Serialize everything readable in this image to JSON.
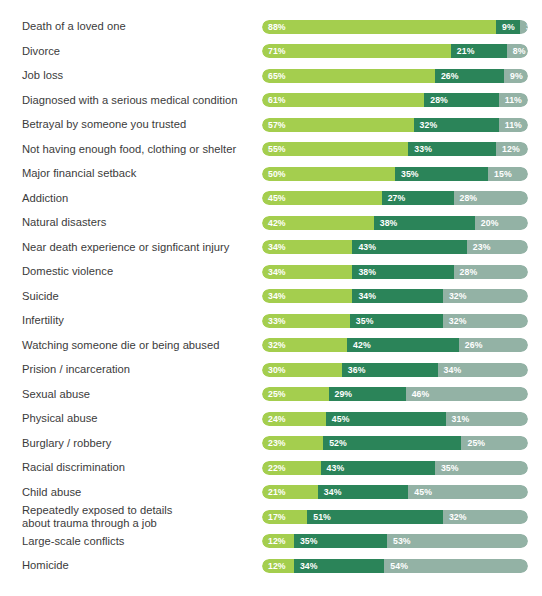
{
  "chart_data": {
    "type": "bar",
    "title": "",
    "subtitle": "",
    "xlabel": "",
    "ylabel": "",
    "orientation": "horizontal",
    "stacked": true,
    "grid": false,
    "legend_position": "none",
    "xlim": [
      0,
      100
    ],
    "value_suffix": "%",
    "colors": {
      "series1": "#a4ce4e",
      "series2": "#2b8459",
      "series3": "#93b2a5",
      "label_text": "#3b3b3b",
      "value_text": "#ffffff",
      "background": "#ffffff"
    },
    "categories": [
      "Death of a loved one",
      "Divorce",
      "Job loss",
      "Diagnosed with a serious medical condition",
      "Betrayal by someone you trusted",
      "Not having enough food, clothing or shelter",
      "Major financial setback",
      "Addiction",
      "Natural disasters",
      "Near death experience or signficant injury",
      "Domestic violence",
      "Suicide",
      "Infertility",
      "Watching someone die or being abused",
      "Prision / incarceration",
      "Sexual abuse",
      "Physical abuse",
      "Burglary / robbery",
      "Racial discrimination",
      "Child abuse",
      "Repeatedly exposed to details about trauma through a job",
      "Large-scale conflicts",
      "Homicide"
    ],
    "series": [
      {
        "name": "series1",
        "values": [
          88,
          71,
          65,
          61,
          57,
          55,
          50,
          45,
          42,
          34,
          34,
          34,
          33,
          32,
          30,
          25,
          24,
          23,
          22,
          21,
          17,
          12,
          12
        ]
      },
      {
        "name": "series2",
        "values": [
          9,
          21,
          26,
          28,
          32,
          33,
          35,
          27,
          38,
          43,
          38,
          34,
          35,
          42,
          36,
          29,
          45,
          52,
          43,
          34,
          51,
          35,
          34
        ]
      },
      {
        "name": "series3",
        "values": [
          3,
          8,
          9,
          11,
          11,
          12,
          15,
          28,
          20,
          23,
          28,
          32,
          32,
          26,
          34,
          46,
          31,
          25,
          35,
          45,
          32,
          53,
          54
        ]
      }
    ]
  },
  "rows": [
    {
      "label_line1": "Death of a loved one",
      "label_line2": "",
      "v1": "88%",
      "v2": "9%",
      "v3": "3%"
    },
    {
      "label_line1": "Divorce",
      "label_line2": "",
      "v1": "71%",
      "v2": "21%",
      "v3": "8%"
    },
    {
      "label_line1": "Job loss",
      "label_line2": "",
      "v1": "65%",
      "v2": "26%",
      "v3": "9%"
    },
    {
      "label_line1": "Diagnosed with a serious medical condition",
      "label_line2": "",
      "v1": "61%",
      "v2": "28%",
      "v3": "11%"
    },
    {
      "label_line1": "Betrayal by someone you trusted",
      "label_line2": "",
      "v1": "57%",
      "v2": "32%",
      "v3": "11%"
    },
    {
      "label_line1": "Not having enough food, clothing or shelter",
      "label_line2": "",
      "v1": "55%",
      "v2": "33%",
      "v3": "12%"
    },
    {
      "label_line1": "Major financial setback",
      "label_line2": "",
      "v1": "50%",
      "v2": "35%",
      "v3": "15%"
    },
    {
      "label_line1": "Addiction",
      "label_line2": "",
      "v1": "45%",
      "v2": "27%",
      "v3": "28%"
    },
    {
      "label_line1": "Natural disasters",
      "label_line2": "",
      "v1": "42%",
      "v2": "38%",
      "v3": "20%"
    },
    {
      "label_line1": "Near death experience or signficant injury",
      "label_line2": "",
      "v1": "34%",
      "v2": "43%",
      "v3": "23%"
    },
    {
      "label_line1": "Domestic violence",
      "label_line2": "",
      "v1": "34%",
      "v2": "38%",
      "v3": "28%"
    },
    {
      "label_line1": "Suicide",
      "label_line2": "",
      "v1": "34%",
      "v2": "34%",
      "v3": "32%"
    },
    {
      "label_line1": "Infertility",
      "label_line2": "",
      "v1": "33%",
      "v2": "35%",
      "v3": "32%"
    },
    {
      "label_line1": "Watching someone die or being abused",
      "label_line2": "",
      "v1": "32%",
      "v2": "42%",
      "v3": "26%"
    },
    {
      "label_line1": "Prision / incarceration",
      "label_line2": "",
      "v1": "30%",
      "v2": "36%",
      "v3": "34%"
    },
    {
      "label_line1": "Sexual abuse",
      "label_line2": "",
      "v1": "25%",
      "v2": "29%",
      "v3": "46%"
    },
    {
      "label_line1": "Physical abuse",
      "label_line2": "",
      "v1": "24%",
      "v2": "45%",
      "v3": "31%"
    },
    {
      "label_line1": "Burglary / robbery",
      "label_line2": "",
      "v1": "23%",
      "v2": "52%",
      "v3": "25%"
    },
    {
      "label_line1": "Racial discrimination",
      "label_line2": "",
      "v1": "22%",
      "v2": "43%",
      "v3": "35%"
    },
    {
      "label_line1": "Child abuse",
      "label_line2": "",
      "v1": "21%",
      "v2": "34%",
      "v3": "45%"
    },
    {
      "label_line1": "Repeatedly exposed to details",
      "label_line2": "about trauma through a job",
      "v1": "17%",
      "v2": "51%",
      "v3": "32%"
    },
    {
      "label_line1": "Large-scale conflicts",
      "label_line2": "",
      "v1": "12%",
      "v2": "35%",
      "v3": "53%"
    },
    {
      "label_line1": "Homicide",
      "label_line2": "",
      "v1": "12%",
      "v2": "34%",
      "v3": "54%"
    }
  ]
}
